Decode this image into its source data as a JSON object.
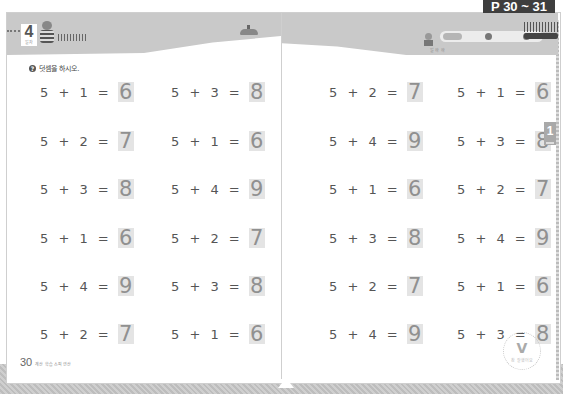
{
  "page_label": "P 30 ~ 31",
  "left_page": {
    "lesson_number": "4",
    "lesson_sub": "일차",
    "instruction": "덧셈을 하시오.",
    "instruction_icon": "question-icon",
    "page_number": "30",
    "footer_text": "계산 학습 스피 연산",
    "equations": [
      {
        "expr": "5 + 1 =",
        "answer": "6"
      },
      {
        "expr": "5 + 3 =",
        "answer": "8"
      },
      {
        "expr": "5 + 2 =",
        "answer": "7"
      },
      {
        "expr": "5 + 1 =",
        "answer": "6"
      },
      {
        "expr": "5 + 3 =",
        "answer": "8"
      },
      {
        "expr": "5 + 4 =",
        "answer": "9"
      },
      {
        "expr": "5 + 1 =",
        "answer": "6"
      },
      {
        "expr": "5 + 2 =",
        "answer": "7"
      },
      {
        "expr": "5 + 4 =",
        "answer": "9"
      },
      {
        "expr": "5 + 3 =",
        "answer": "8"
      },
      {
        "expr": "5 + 2 =",
        "answer": "7"
      },
      {
        "expr": "5 + 1 =",
        "answer": "6"
      }
    ]
  },
  "right_page": {
    "chapter_tab": "1",
    "kid_caption": "일 하 하",
    "equations": [
      {
        "expr": "5 + 2 =",
        "answer": "7"
      },
      {
        "expr": "5 + 1 =",
        "answer": "6"
      },
      {
        "expr": "5 + 4 =",
        "answer": "9"
      },
      {
        "expr": "5 + 3 =",
        "answer": "8"
      },
      {
        "expr": "5 + 1 =",
        "answer": "6"
      },
      {
        "expr": "5 + 2 =",
        "answer": "7"
      },
      {
        "expr": "5 + 3 =",
        "answer": "8"
      },
      {
        "expr": "5 + 4 =",
        "answer": "9"
      },
      {
        "expr": "5 + 2 =",
        "answer": "7"
      },
      {
        "expr": "5 + 1 =",
        "answer": "6"
      },
      {
        "expr": "5 + 4 =",
        "answer": "9"
      },
      {
        "expr": "5 + 3 =",
        "answer": "8"
      }
    ],
    "stamp": {
      "mark": "V",
      "text": "참 잘했어요"
    }
  },
  "colors": {
    "header_band": "#c9c9c9",
    "answer_box": "#e4e4e4",
    "answer_text": "#909090",
    "page_label_bg": "#3e3e3e"
  }
}
